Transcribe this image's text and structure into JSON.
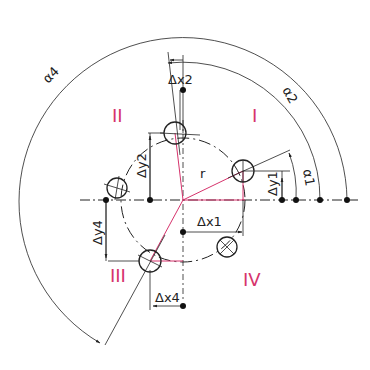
{
  "diagram": {
    "type": "bolt-circle-coordinate-dimensioning",
    "quadrant_labels": {
      "q1": "I",
      "q2": "II",
      "q3": "III",
      "q4": "IV"
    },
    "labels": {
      "radius": "r",
      "alpha1": "α1",
      "alpha2": "α2",
      "alpha4": "α4",
      "dx1": "Δx1",
      "dx2": "Δx2",
      "dx4": "Δx4",
      "dy1": "Δy1",
      "dy2": "Δy2",
      "dy4": "Δy4"
    },
    "colors": {
      "line": "#222222",
      "accent": "#d6336c",
      "background": "#ffffff"
    }
  }
}
